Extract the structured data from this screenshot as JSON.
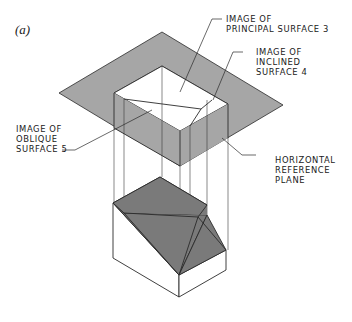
{
  "figure": {
    "label": "(a)"
  },
  "labels": {
    "principal": {
      "line1": "IMAGE OF",
      "line2": "PRINCIPAL SURFACE 3"
    },
    "inclined": {
      "line1": "IMAGE OF",
      "line2": "INCLINED",
      "line3": "SURFACE 4"
    },
    "oblique": {
      "line1": "IMAGE OF",
      "line2": "OBLIQUE",
      "line3": "SURFACE 5"
    },
    "plane": {
      "line1": "HORIZONTAL",
      "line2": "REFERENCE",
      "line3": "PLANE"
    }
  },
  "colors": {
    "plane_fill": "#a6a6a6",
    "object_shaded": "#7a7a7a",
    "object_white": "#ffffff",
    "line": "#2a2a2a"
  }
}
